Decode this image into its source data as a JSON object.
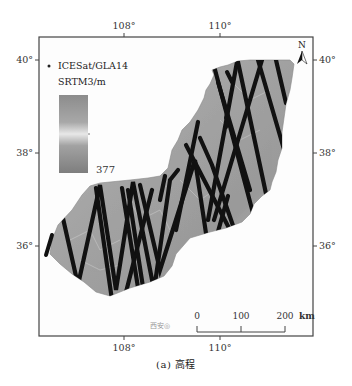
{
  "figure": {
    "caption": "(a) 高程",
    "map": {
      "top_ticks": [
        {
          "label": "108°",
          "x": 124
        },
        {
          "label": "110°",
          "x": 220
        }
      ],
      "bottom_ticks": [
        {
          "label": "108°",
          "x": 124
        },
        {
          "label": "110°",
          "x": 220
        }
      ],
      "left_ticks": [
        {
          "label": "40°",
          "y": 60
        },
        {
          "label": "38°",
          "y": 153
        },
        {
          "label": "36°",
          "y": 246
        }
      ],
      "right_ticks": [
        {
          "label": "40°",
          "y": 60
        },
        {
          "label": "38°",
          "y": 153
        },
        {
          "label": "36°",
          "y": 246
        }
      ],
      "north_arrow_label": "N",
      "city_label": "西安◎"
    },
    "legend": {
      "track_label": "ICESat/GLA14",
      "raster_label": "SRTM3/m",
      "colorbar_min": "377",
      "colorbar_colors": [
        "#8c8c8c",
        "#a6a6a6",
        "#e6e6e6",
        "#a0a0a0",
        "#7e7e7e"
      ]
    },
    "scale_bar": {
      "labels": [
        "0",
        "100",
        "200"
      ],
      "unit": "km"
    }
  }
}
